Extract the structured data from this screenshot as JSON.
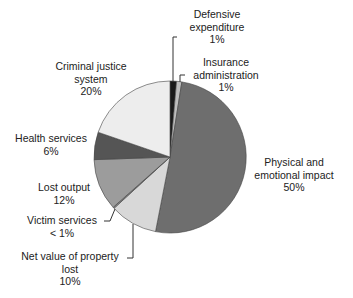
{
  "chart_data": {
    "type": "pie",
    "title": "",
    "start_angle_deg": 0,
    "direction": "clockwise",
    "slices": [
      {
        "label": "Defensive expenditure",
        "value_label": "1%",
        "value": 1,
        "color": "#1a1a1a",
        "angle": [
          0,
          5
        ]
      },
      {
        "label": "Insurance administration",
        "value_label": "1%",
        "value": 1,
        "color": "#bdbdbd",
        "angle": [
          5,
          9
        ]
      },
      {
        "label": "Physical and emotional impact",
        "value_label": "50%",
        "value": 50,
        "color": "#6e6e6e",
        "angle": [
          9,
          191
        ]
      },
      {
        "label": "Net value of property lost",
        "value_label": "10%",
        "value": 10,
        "color": "#d8d8d8",
        "angle": [
          191,
          227.5
        ]
      },
      {
        "label": "Victim services",
        "value_label": "< 1%",
        "value": 0.5,
        "color": "#8a8a8a",
        "angle": [
          227.5,
          228.5
        ]
      },
      {
        "label": "Lost output",
        "value_label": "12%",
        "value": 12,
        "color": "#9c9c9c",
        "angle": [
          228.5,
          268
        ]
      },
      {
        "label": "Health services",
        "value_label": "6%",
        "value": 6,
        "color": "#555555",
        "angle": [
          268,
          289
        ]
      },
      {
        "label": "Criminal justice system",
        "value_label": "20%",
        "value": 20,
        "color": "#ededed",
        "angle": [
          289,
          360
        ]
      }
    ],
    "legend": "none (direct labels with leader lines)"
  },
  "labels": {
    "defensive": {
      "line1": "Defensive",
      "line2": "expenditure",
      "pct": "1%"
    },
    "insurance": {
      "line1": "Insurance",
      "line2": "administration",
      "pct": "1%"
    },
    "physical": {
      "line1": "Physical and",
      "line2": "emotional impact",
      "pct": "50%"
    },
    "property": {
      "line1": "Net value of property",
      "line2": "lost",
      "pct": "10%"
    },
    "victim": {
      "line1": "Victim services",
      "pct": "< 1%"
    },
    "lost_output": {
      "line1": "Lost output",
      "pct": "12%"
    },
    "health": {
      "line1": "Health services",
      "pct": "6%"
    },
    "criminal": {
      "line1": "Criminal justice",
      "line2": "system",
      "pct": "20%"
    }
  }
}
